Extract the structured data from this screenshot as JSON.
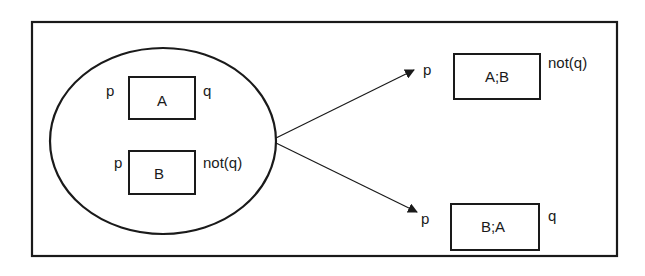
{
  "diagram": {
    "left_group": {
      "box_a": {
        "label": "A",
        "pre": "p",
        "post": "q"
      },
      "box_b": {
        "label": "B",
        "pre": "p",
        "post": "not(q)"
      }
    },
    "outcomes": [
      {
        "label": "A;B",
        "pre": "p",
        "post": "not(q)"
      },
      {
        "label": "B;A",
        "pre": "p",
        "post": "q"
      }
    ]
  },
  "colors": {
    "stroke": "#1a1a1a",
    "background": "#ffffff"
  }
}
